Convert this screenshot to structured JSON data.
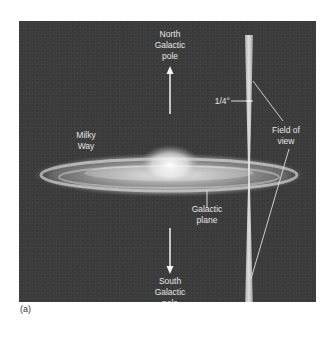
{
  "figure": {
    "caption": "(a)",
    "labels": {
      "north_pole": "North\nGalactic\npole",
      "south_pole": "South\nGalactic\npole",
      "milky_way": "Milky\nWay",
      "galactic_plane": "Galactic\nplane",
      "field_of_view": "Field of\nview",
      "angle": "1/4°"
    },
    "colors": {
      "background": "#3c3c3c",
      "label": "#e6e6e6",
      "galaxy_glow": "#f2f2f2"
    }
  }
}
